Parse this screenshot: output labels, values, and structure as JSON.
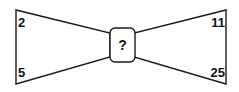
{
  "diagram": {
    "type": "bowtie-number-puzzle",
    "stroke_color": "#1a1a1a",
    "fill_color": "#ffffff",
    "text_color": "#111111",
    "corners": {
      "top_left": "2",
      "bottom_left": "5",
      "top_right": "11",
      "bottom_right": "25"
    },
    "center": {
      "label": "?",
      "shape": "rounded-rectangle"
    }
  }
}
